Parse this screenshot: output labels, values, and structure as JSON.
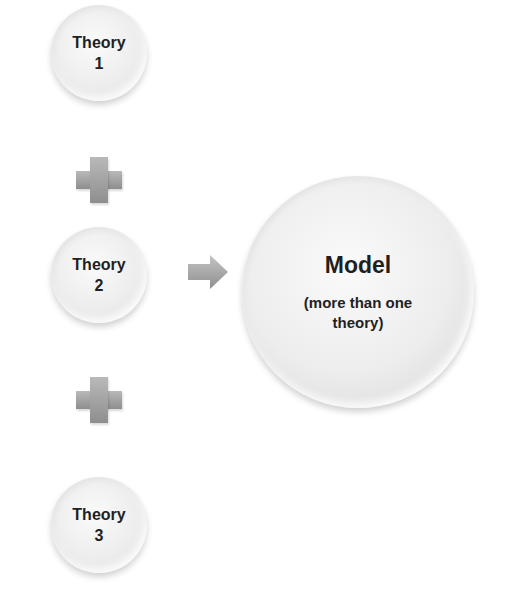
{
  "diagram": {
    "theories": [
      {
        "label": "Theory",
        "number": "1"
      },
      {
        "label": "Theory",
        "number": "2"
      },
      {
        "label": "Theory",
        "number": "3"
      }
    ],
    "connectors": [
      "plus-icon",
      "plus-icon"
    ],
    "arrow": "right-arrow-icon",
    "model": {
      "title": "Model",
      "subtitle_line1": "(more than one",
      "subtitle_line2": "theory)"
    }
  },
  "colors": {
    "circle_fill": "#ececec",
    "text": "#1f1f1f",
    "connector": "#9e9e9e"
  }
}
